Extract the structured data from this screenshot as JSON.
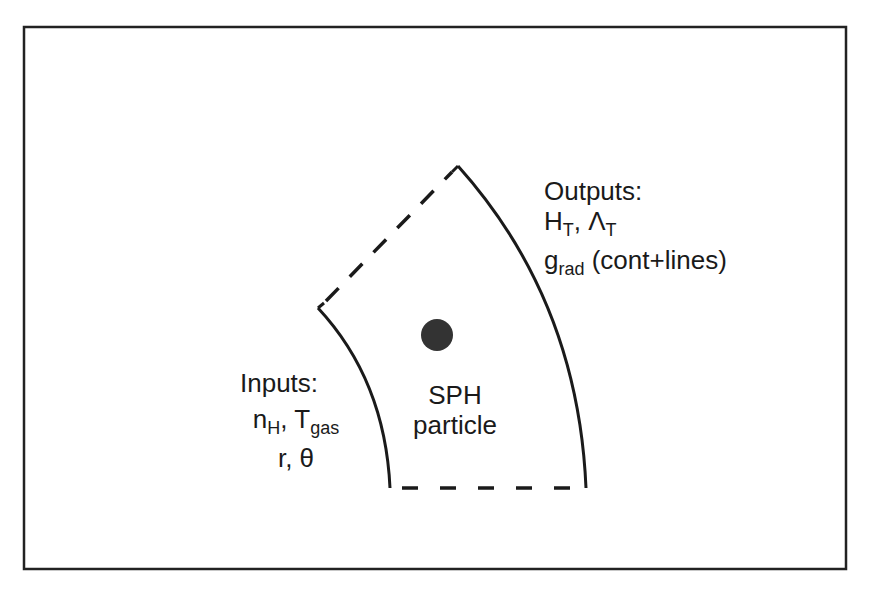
{
  "diagram": {
    "frame": {
      "stroke": "#222222"
    },
    "wedge": {
      "solid_stroke": "#1a1a1a",
      "dashed_stroke": "#1a1a1a"
    },
    "particle_dot": {
      "fill": "#333333"
    },
    "outputs": {
      "title": "Outputs:",
      "line1_a": "H",
      "line1_a_sub": "T",
      "line1_sep": ", ",
      "line1_b": "Λ",
      "line1_b_sub": "T",
      "line2_a": "g",
      "line2_a_sub": "rad",
      "line2_rest": " (cont+lines)"
    },
    "inputs": {
      "title": "Inputs:",
      "line1_a": "n",
      "line1_a_sub": "H",
      "line1_sep": ", T",
      "line1_b_sub": "gas",
      "line2": "r, θ"
    },
    "center_label": {
      "line1": "SPH",
      "line2": "particle"
    }
  }
}
